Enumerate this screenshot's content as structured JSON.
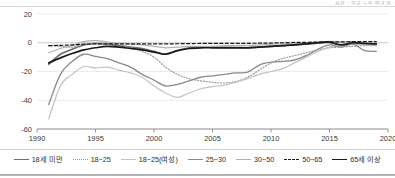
{
  "header": {
    "note": "자료 : 한국 노동 연구원"
  },
  "legend": {
    "items": [
      {
        "label": "18세 미만",
        "color": "#6e6e6e",
        "style": "solid",
        "width": 1.6
      },
      {
        "label": "18~25",
        "color": "#9a9a9a",
        "style": "dotted",
        "width": 1.2
      },
      {
        "label": "18~25(여성)",
        "color": "#c2c2c2",
        "style": "solid",
        "width": 1.2
      },
      {
        "label": "25~30",
        "color": "#8a8a8a",
        "style": "solid",
        "width": 1.3
      },
      {
        "label": "30~50",
        "color": "#b0b0b0",
        "style": "solid",
        "width": 1.2
      },
      {
        "label": "50~65",
        "color": "#1a1a1a",
        "style": "dashed",
        "width": 1.2
      },
      {
        "label": "65세 이상",
        "color": "#1a1a1a",
        "style": "solid",
        "width": 1.7
      }
    ]
  },
  "chart_data": {
    "type": "line",
    "title": "",
    "xlabel": "",
    "ylabel": "",
    "xlim": [
      1990,
      2020
    ],
    "ylim": [
      -60,
      20
    ],
    "xticks": [
      1990,
      1995,
      2000,
      2005,
      2010,
      2015,
      2020
    ],
    "yticks": [
      20,
      0,
      -20,
      -40,
      -60
    ],
    "grid": true,
    "legend_position": "bottom",
    "x": [
      1991,
      1992,
      1993,
      1994,
      1995,
      1996,
      1997,
      1998,
      1999,
      2000,
      2001,
      2002,
      2003,
      2004,
      2005,
      2006,
      2007,
      2008,
      2009,
      2010,
      2011,
      2012,
      2013,
      2014,
      2015,
      2016,
      2017,
      2018,
      2019
    ],
    "series": [
      {
        "name": "18세 미만",
        "color": "#6e6e6e",
        "style": "solid",
        "width": 1.6,
        "values": [
          -15.0,
          -8.0,
          -4.5,
          -1.5,
          -0.5,
          -1.0,
          -2.0,
          -3.0,
          -4.0,
          -6.0,
          -7.8,
          -5.5,
          -3.5,
          -3.0,
          -3.0,
          -3.2,
          -3.3,
          -3.5,
          -3.0,
          -2.5,
          -2.0,
          -1.5,
          -1.0,
          -0.3,
          0.2,
          -1.5,
          0.0,
          -0.5,
          -0.8
        ]
      },
      {
        "name": "18~25",
        "color": "#9a9a9a",
        "style": "dotted",
        "width": 1.2,
        "values": [
          -2.0,
          -2.5,
          -3.0,
          -1.0,
          -0.3,
          -0.5,
          -1.5,
          -3.5,
          -6.0,
          -10.0,
          -17.0,
          -22.0,
          -25.0,
          -26.5,
          -27.5,
          -28.0,
          -27.0,
          -24.0,
          -19.0,
          -14.0,
          -11.0,
          -9.0,
          -7.0,
          -5.0,
          -3.5,
          -3.0,
          -2.5,
          -2.0,
          -2.0
        ]
      },
      {
        "name": "18~25(여성)",
        "color": "#c2c2c2",
        "style": "solid",
        "width": 1.2,
        "values": [
          -53.0,
          -30.0,
          -22.0,
          -16.5,
          -17.5,
          -17.0,
          -19.0,
          -21.0,
          -24.0,
          -30.0,
          -35.0,
          -38.0,
          -35.0,
          -32.0,
          -30.5,
          -29.5,
          -27.5,
          -25.0,
          -22.0,
          -20.0,
          -18.0,
          -14.0,
          -10.0,
          -6.0,
          -3.0,
          -2.0,
          -1.0,
          -1.5,
          -2.0
        ]
      },
      {
        "name": "25~30",
        "color": "#8a8a8a",
        "style": "solid",
        "width": 1.3,
        "values": [
          -43.0,
          -22.0,
          -13.0,
          -8.0,
          -9.5,
          -11.0,
          -14.0,
          -17.0,
          -22.0,
          -26.0,
          -30.0,
          -29.0,
          -26.5,
          -24.0,
          -23.0,
          -22.0,
          -21.0,
          -20.5,
          -15.5,
          -13.5,
          -13.0,
          -12.0,
          -9.0,
          -4.5,
          -1.5,
          -3.0,
          -1.0,
          -5.5,
          -6.0
        ]
      },
      {
        "name": "30~50",
        "color": "#b0b0b0",
        "style": "solid",
        "width": 1.2,
        "values": [
          -7.0,
          -4.0,
          -2.0,
          0.8,
          1.5,
          0.5,
          -0.5,
          -1.0,
          -1.5,
          -2.5,
          -3.5,
          -3.0,
          -2.5,
          -2.5,
          -2.5,
          -2.0,
          -2.0,
          -2.0,
          -1.5,
          -1.0,
          -0.8,
          -0.5,
          0.0,
          0.5,
          1.0,
          0.5,
          0.8,
          -1.0,
          -1.5
        ]
      },
      {
        "name": "50~65",
        "color": "#1a1a1a",
        "style": "dashed",
        "width": 1.2,
        "values": [
          -2.0,
          -1.8,
          -1.5,
          -1.0,
          -0.8,
          -0.8,
          -0.8,
          -0.8,
          -0.8,
          -0.8,
          -0.8,
          -0.7,
          -0.6,
          -0.5,
          -0.5,
          -0.4,
          -0.4,
          -0.4,
          -0.3,
          -0.2,
          0.0,
          0.2,
          0.3,
          0.5,
          0.7,
          0.6,
          0.8,
          0.8,
          0.8
        ]
      },
      {
        "name": "65세 이상",
        "color": "#1a1a1a",
        "style": "solid",
        "width": 1.7,
        "values": [
          -14.0,
          -10.5,
          -7.5,
          -5.0,
          -3.5,
          -2.5,
          -3.0,
          -4.0,
          -5.0,
          -6.5,
          -8.0,
          -5.5,
          -4.0,
          -3.5,
          -3.5,
          -3.5,
          -3.5,
          -3.5,
          -3.0,
          -2.5,
          -2.0,
          -1.5,
          -0.8,
          0.0,
          0.5,
          -1.5,
          0.0,
          -0.5,
          -0.8
        ]
      }
    ]
  }
}
